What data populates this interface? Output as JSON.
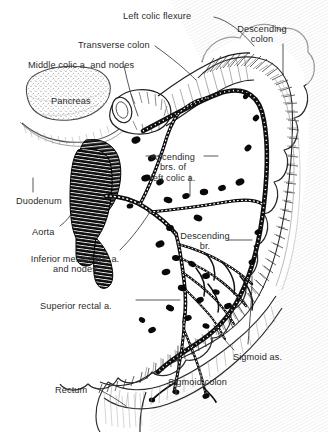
{
  "figure": {
    "background_color": "#ffffff",
    "ink_color": "#1a1a1a",
    "style": "black-and-white pen-and-ink anatomical line drawing"
  },
  "labels": [
    {
      "id": "left-colic-flexure",
      "text": "Left colic flexure",
      "x": 123,
      "y": 11,
      "align": "left"
    },
    {
      "id": "descending-colon",
      "text": "Descending\ncolon",
      "x": 262,
      "y": 24,
      "align": "center"
    },
    {
      "id": "transverse-colon",
      "text": "Transverse colon",
      "x": 78,
      "y": 40,
      "align": "left"
    },
    {
      "id": "middle-colic-a",
      "text": "Middle colic a. and nodes",
      "x": 28,
      "y": 60,
      "align": "left"
    },
    {
      "id": "pancreas",
      "text": "Pancreas",
      "x": 51,
      "y": 96,
      "align": "left"
    },
    {
      "id": "ascending-brs",
      "text": "Ascending\nbrs. of\nleft colic a.",
      "x": 173,
      "y": 152,
      "align": "center"
    },
    {
      "id": "duodenum",
      "text": "Duodenum",
      "x": 16,
      "y": 196,
      "align": "left"
    },
    {
      "id": "aorta",
      "text": "Aorta",
      "x": 32,
      "y": 227,
      "align": "left"
    },
    {
      "id": "descending-br",
      "text": "Descending\nbr.",
      "x": 205,
      "y": 231,
      "align": "center"
    },
    {
      "id": "inferior-mesenteric-a",
      "text": "Inferior mesenteric a.\nand nodes",
      "x": 75,
      "y": 254,
      "align": "center"
    },
    {
      "id": "superior-rectal-a",
      "text": "Superior rectal a.",
      "x": 40,
      "y": 301,
      "align": "left"
    },
    {
      "id": "sigmoid-as",
      "text": "Sigmoid as.",
      "x": 233,
      "y": 352,
      "align": "left"
    },
    {
      "id": "sigmoid-colon",
      "text": "Sigmoid colon",
      "x": 168,
      "y": 377,
      "align": "left"
    },
    {
      "id": "rectum",
      "text": "Rectum",
      "x": 55,
      "y": 385,
      "align": "left"
    }
  ],
  "structures": [
    {
      "id": "transverse-colon-body",
      "name": "transverse colon"
    },
    {
      "id": "left-colic-flexure-body",
      "name": "left colic flexure (splenic flexure)"
    },
    {
      "id": "descending-colon-body",
      "name": "descending colon"
    },
    {
      "id": "sigmoid-colon-body",
      "name": "sigmoid colon"
    },
    {
      "id": "rectum-body",
      "name": "rectum"
    },
    {
      "id": "pancreas-body",
      "name": "pancreas"
    },
    {
      "id": "duodenum-body",
      "name": "duodenum"
    },
    {
      "id": "aorta-body",
      "name": "abdominal aorta with bifurcation"
    },
    {
      "id": "inferior-mesenteric-artery",
      "name": "inferior mesenteric artery"
    },
    {
      "id": "left-colic-artery",
      "name": "left colic artery"
    },
    {
      "id": "marginal-artery",
      "name": "marginal artery arcade"
    },
    {
      "id": "lymph-nodes",
      "name": "lymph nodes"
    },
    {
      "id": "vasa-recta",
      "name": "vasa recta"
    }
  ]
}
